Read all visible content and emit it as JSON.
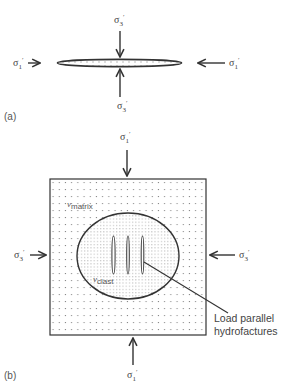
{
  "panel_a": {
    "label": "(a)",
    "stress_top": {
      "symbol": "σ",
      "sub": "3",
      "prime": "′"
    },
    "stress_bottom": {
      "symbol": "σ",
      "sub": "3",
      "prime": "′"
    },
    "stress_left": {
      "symbol": "σ",
      "sub": "1",
      "prime": "′"
    },
    "stress_right": {
      "symbol": "σ",
      "sub": "1",
      "prime": "′"
    }
  },
  "panel_b": {
    "label": "(b)",
    "stress_top": {
      "symbol": "σ",
      "sub": "1",
      "prime": "′"
    },
    "stress_bottom": {
      "symbol": "σ",
      "sub": "1",
      "prime": "′"
    },
    "stress_left": {
      "symbol": "σ",
      "sub": "3",
      "prime": "′"
    },
    "stress_right": {
      "symbol": "σ",
      "sub": "3",
      "prime": "′"
    },
    "matrix_label": {
      "symbol": "ν",
      "sub": "matrix"
    },
    "clast_label": {
      "symbol": "ν",
      "sub": "clast"
    },
    "annotation": {
      "line1": "Load parallel",
      "line2": "hydrofactures"
    }
  },
  "colors": {
    "stroke": "#333333",
    "dots": "#888888",
    "text": "#444444"
  }
}
